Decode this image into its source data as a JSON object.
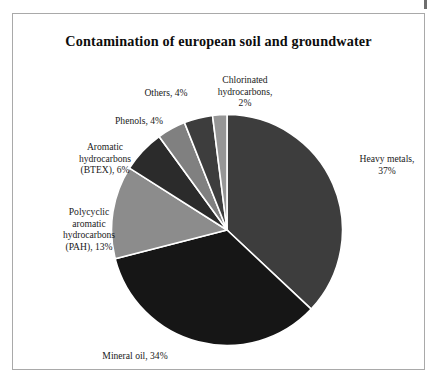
{
  "chart_data": {
    "type": "pie",
    "title": "Contamination of european soil and groundwater",
    "unit": "%",
    "start_angle_deg": 0,
    "direction": "clockwise",
    "legend": "none (direct labels)",
    "categories": [
      "Heavy metals",
      "Mineral oil",
      "Polycyclic aromatic hydrocarbons (PAH)",
      "Aromatic hydrocarbons (BTEX)",
      "Phenols",
      "Others",
      "Chlorinated hydrocarbons"
    ],
    "values": [
      37,
      34,
      13,
      6,
      4,
      4,
      2
    ],
    "slices": [
      {
        "name": "Heavy metals",
        "value": 37,
        "label": "Heavy metals,\n37%",
        "color": "#3d3d3d"
      },
      {
        "name": "Mineral oil",
        "value": 34,
        "label": "Mineral oil, 34%",
        "color": "#161616"
      },
      {
        "name": "Polycyclic aromatic hydrocarbons (PAH)",
        "value": 13,
        "label": "Polycyclic\naromatic\nhydrocarbons\n(PAH), 13%",
        "color": "#8c8c8c"
      },
      {
        "name": "Aromatic hydrocarbons (BTEX)",
        "value": 6,
        "label": "Aromatic\nhydrocarbons\n(BTEX), 6%",
        "color": "#2b2b2b"
      },
      {
        "name": "Phenols",
        "value": 4,
        "label": "Phenols, 4%",
        "color": "#808080"
      },
      {
        "name": "Others",
        "value": 4,
        "label": "Others, 4%",
        "color": "#3d3d3d"
      },
      {
        "name": "Chlorinated hydrocarbons",
        "value": 2,
        "label": "Chlorinated\nhydrocarbons,\n2%",
        "color": "#969696"
      }
    ],
    "xlabel": "",
    "ylabel": ""
  },
  "frame": {
    "border_color": "#a9a9a9",
    "background": "#ffffff"
  }
}
